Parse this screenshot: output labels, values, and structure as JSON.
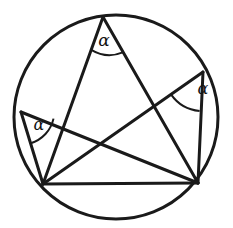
{
  "figure": {
    "background_color": "#ffffff",
    "stroke_color": "#1a1a1a",
    "canvas": {
      "width": 233,
      "height": 228
    }
  },
  "circle": {
    "name": "circumscribed-circle",
    "cx": 116,
    "cy": 117,
    "r": 102,
    "stroke_width": 3.0
  },
  "points": [
    {
      "id": "T",
      "label": "top-vertex",
      "x": 103,
      "y": 17
    },
    {
      "id": "R",
      "label": "upper-right-vertex",
      "x": 203,
      "y": 72
    },
    {
      "id": "L",
      "label": "left-vertex",
      "x": 21,
      "y": 112
    },
    {
      "id": "B1",
      "label": "bottom-left-vertex",
      "x": 43,
      "y": 184
    },
    {
      "id": "B2",
      "label": "bottom-right-vertex",
      "x": 198,
      "y": 183
    }
  ],
  "chords": [
    {
      "name": "chord-base-b1-b2",
      "x1": 43,
      "y1": 184,
      "x2": 198,
      "y2": 183,
      "width": 3.0
    },
    {
      "name": "chord-top-to-b1",
      "x1": 103,
      "y1": 17,
      "x2": 43,
      "y2": 184,
      "width": 3.0
    },
    {
      "name": "chord-top-to-b2",
      "x1": 103,
      "y1": 17,
      "x2": 198,
      "y2": 183,
      "width": 3.0
    },
    {
      "name": "chord-right-to-b1",
      "x1": 203,
      "y1": 72,
      "x2": 43,
      "y2": 184,
      "width": 3.0
    },
    {
      "name": "chord-right-to-b2",
      "x1": 203,
      "y1": 72,
      "x2": 198,
      "y2": 183,
      "width": 3.0
    },
    {
      "name": "chord-left-to-b1",
      "x1": 21,
      "y1": 112,
      "x2": 43,
      "y2": 184,
      "width": 3.0
    },
    {
      "name": "chord-left-to-b2",
      "x1": 21,
      "y1": 112,
      "x2": 198,
      "y2": 183,
      "width": 3.0
    }
  ],
  "angle_marks": [
    {
      "id": "angle-top",
      "label": "α",
      "vertex": "T",
      "arc_path": "M 91.3 49.9 A 35 35 0 0 0 122.8 52.4",
      "label_x": 104,
      "label_y": 46,
      "font_size": 17,
      "arc_width": 2.0
    },
    {
      "id": "angle-right",
      "label": "α",
      "vertex": "R",
      "arc_path": "M 171.0 94.4 A 39 39 0 0 0 199.6 111.0",
      "label_x": 203,
      "label_y": 94,
      "font_size": 16,
      "arc_width": 2.0
    },
    {
      "id": "angle-left",
      "label": "α",
      "vertex": "L",
      "arc_path": "M 30.7 143.2 A 33 33 0 0 0 53.5 118.6",
      "label_x": 39,
      "label_y": 130,
      "font_size": 16,
      "arc_width": 2.0
    }
  ]
}
